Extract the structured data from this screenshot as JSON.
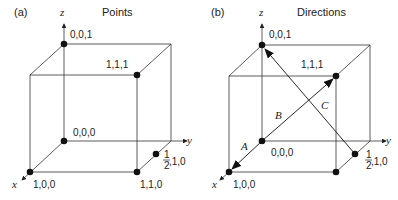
{
  "panels": [
    {
      "tag": "(a)",
      "title": "Points",
      "axes": {
        "x": "x",
        "y": "y",
        "z": "z"
      },
      "points": [
        {
          "label": "0,0,1"
        },
        {
          "label": "1,1,1"
        },
        {
          "label": "0,0,0"
        },
        {
          "label": "1,0,0"
        },
        {
          "label": "1,1,0"
        },
        {
          "label_num": "1",
          "label_den": "2",
          "label_rest": ",1,0"
        }
      ]
    },
    {
      "tag": "(b)",
      "title": "Directions",
      "axes": {
        "x": "x",
        "y": "y",
        "z": "z"
      },
      "points": [
        {
          "label": "0,0,1"
        },
        {
          "label": "1,1,1"
        },
        {
          "label": "0,0,0"
        },
        {
          "label": "1,0,0"
        },
        {
          "label_num": "1",
          "label_den": "2",
          "label_rest": ",1,0"
        }
      ],
      "vectors": [
        {
          "name": "A",
          "from": "0,0,0",
          "to": "1,0,0"
        },
        {
          "name": "B",
          "from": "0,0,0",
          "to": "1,1,1"
        },
        {
          "name": "C",
          "from": "1/2,1,0",
          "to": "0,0,1"
        }
      ]
    }
  ]
}
